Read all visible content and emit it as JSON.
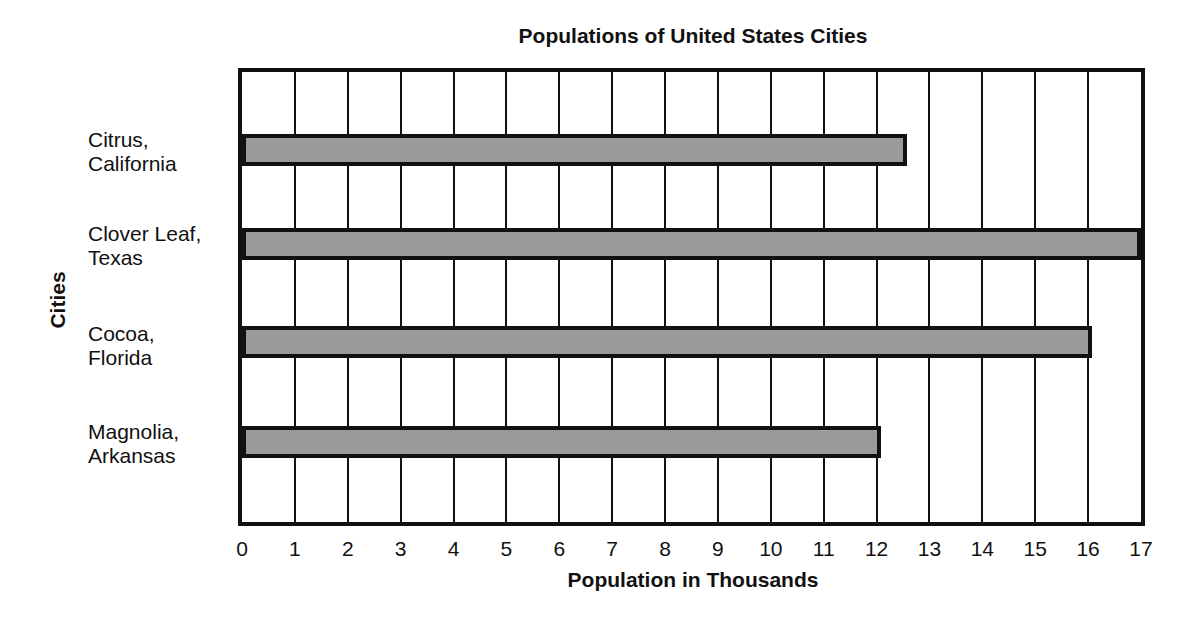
{
  "chart_data": {
    "type": "bar",
    "orientation": "horizontal",
    "title": "Populations of United States Cities",
    "xlabel": "Population in Thousands",
    "ylabel": "Cities",
    "categories": [
      "Citrus, California",
      "Clover Leaf, Texas",
      "Cocoa, Florida",
      "Magnolia, Arkansas"
    ],
    "category_lines": [
      [
        "Citrus,",
        "California"
      ],
      [
        "Clover Leaf,",
        "Texas"
      ],
      [
        "Cocoa,",
        "Florida"
      ],
      [
        "Magnolia,",
        "Arkansas"
      ]
    ],
    "values": [
      12.5,
      17,
      16,
      12
    ],
    "xlim": [
      0,
      17
    ],
    "xticks": [
      "0",
      "1",
      "2",
      "3",
      "4",
      "5",
      "6",
      "7",
      "8",
      "9",
      "10",
      "11",
      "12",
      "13",
      "14",
      "15",
      "16",
      "17"
    ],
    "grid": true,
    "bar_color": "#9a9a9a",
    "legend": null
  }
}
